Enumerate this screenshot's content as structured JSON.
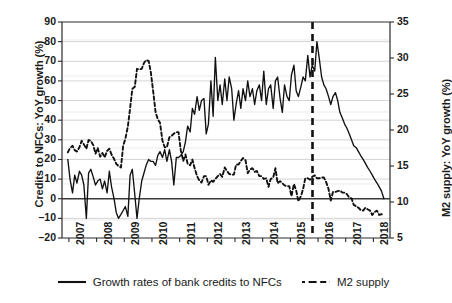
{
  "chart_data": {
    "type": "line",
    "title": "",
    "xlabel": "",
    "ylabel": "Credits to NFCs: YoY growth (%)",
    "ylabel_right": "M2 supply: YoY growth (%)",
    "grid": true,
    "legend_position": "bottom",
    "xlim": [
      2006.75,
      2018.6
    ],
    "ylim": [
      -20,
      90
    ],
    "ylim_right": [
      5,
      35
    ],
    "xticks": [
      "2007",
      "2008",
      "2009",
      "2010",
      "2011",
      "2012",
      "2013",
      "2014",
      "2015",
      "2016",
      "2017",
      "2018"
    ],
    "xtick_values": [
      2007,
      2008,
      2009,
      2010,
      2011,
      2012,
      2013,
      2014,
      2015,
      2016,
      2017,
      2018
    ],
    "yticks_left": [
      -20,
      -10,
      0,
      10,
      20,
      30,
      40,
      50,
      60,
      70,
      80,
      90
    ],
    "yticks_right": [
      5,
      10,
      15,
      20,
      25,
      30,
      35
    ],
    "zero_line": 0,
    "annotations": [
      {
        "name": "structural-break-line",
        "type": "vline",
        "x": 2015.8,
        "style": "dashed",
        "color": "#111111"
      }
    ],
    "series": [
      {
        "name": "Growth rates of bank credits to NFCs",
        "axis": "left",
        "style": "solid",
        "color": "#111111",
        "x": [
          2006.96,
          2007.04,
          2007.13,
          2007.21,
          2007.29,
          2007.38,
          2007.46,
          2007.54,
          2007.63,
          2007.71,
          2007.79,
          2007.88,
          2007.96,
          2008.04,
          2008.13,
          2008.21,
          2008.29,
          2008.38,
          2008.46,
          2008.54,
          2008.63,
          2008.71,
          2008.79,
          2008.88,
          2008.96,
          2009.04,
          2009.13,
          2009.21,
          2009.29,
          2009.38,
          2009.46,
          2009.54,
          2009.63,
          2009.71,
          2009.79,
          2009.88,
          2009.96,
          2010.04,
          2010.13,
          2010.21,
          2010.29,
          2010.38,
          2010.46,
          2010.54,
          2010.63,
          2010.71,
          2010.79,
          2010.88,
          2010.96,
          2011.04,
          2011.13,
          2011.21,
          2011.29,
          2011.38,
          2011.46,
          2011.54,
          2011.63,
          2011.71,
          2011.79,
          2011.88,
          2011.96,
          2012.04,
          2012.13,
          2012.21,
          2012.29,
          2012.38,
          2012.46,
          2012.54,
          2012.63,
          2012.71,
          2012.79,
          2012.88,
          2012.96,
          2013.04,
          2013.13,
          2013.21,
          2013.29,
          2013.38,
          2013.46,
          2013.54,
          2013.63,
          2013.71,
          2013.79,
          2013.88,
          2013.96,
          2014.04,
          2014.13,
          2014.21,
          2014.29,
          2014.38,
          2014.46,
          2014.54,
          2014.63,
          2014.71,
          2014.79,
          2014.88,
          2014.96,
          2015.04,
          2015.13,
          2015.21,
          2015.29,
          2015.38,
          2015.46,
          2015.54,
          2015.63,
          2015.71,
          2015.79,
          2015.88,
          2015.96,
          2016.04,
          2016.13,
          2016.21,
          2016.29,
          2016.38,
          2016.46,
          2016.54,
          2016.63,
          2016.71,
          2016.79,
          2016.88,
          2016.96,
          2017.04,
          2017.13,
          2017.21,
          2017.29,
          2017.38,
          2017.46,
          2017.54,
          2017.63,
          2017.71,
          2017.79,
          2017.88,
          2017.96,
          2018.04,
          2018.13,
          2018.21,
          2018.29,
          2018.38
        ],
        "y": [
          20,
          10,
          3,
          12,
          8,
          14,
          12,
          7,
          -10,
          13,
          15,
          11,
          7,
          9,
          10,
          5,
          9,
          3,
          14,
          6,
          0,
          -7,
          -10,
          -8,
          -6,
          -4,
          -9,
          12,
          15,
          2,
          -10,
          0,
          9,
          13,
          17,
          20,
          19,
          19,
          17,
          22,
          24,
          21,
          25,
          19,
          25,
          19,
          7,
          21,
          21,
          22,
          24,
          29,
          37,
          34,
          46,
          43,
          52,
          45,
          50,
          51,
          33,
          38,
          60,
          42,
          72,
          50,
          58,
          48,
          61,
          50,
          62,
          56,
          40,
          48,
          55,
          46,
          56,
          50,
          60,
          52,
          56,
          48,
          55,
          58,
          50,
          65,
          48,
          56,
          58,
          46,
          60,
          62,
          51,
          44,
          58,
          52,
          50,
          63,
          68,
          55,
          52,
          57,
          62,
          60,
          73,
          62,
          68,
          65,
          80,
          72,
          62,
          58,
          56,
          52,
          48,
          52,
          54,
          50,
          44,
          41,
          38,
          36,
          33,
          30,
          27,
          26,
          24,
          22,
          20,
          18,
          16,
          14,
          12,
          10,
          8,
          6,
          4,
          0
        ]
      },
      {
        "name": "M2 supply",
        "axis": "right",
        "style": "dashed",
        "color": "#111111",
        "x": [
          2006.96,
          2007.04,
          2007.13,
          2007.21,
          2007.29,
          2007.38,
          2007.46,
          2007.54,
          2007.63,
          2007.71,
          2007.79,
          2007.88,
          2007.96,
          2008.04,
          2008.13,
          2008.21,
          2008.29,
          2008.38,
          2008.46,
          2008.54,
          2008.63,
          2008.71,
          2008.79,
          2008.88,
          2008.96,
          2009.04,
          2009.13,
          2009.21,
          2009.29,
          2009.38,
          2009.46,
          2009.54,
          2009.63,
          2009.71,
          2009.79,
          2009.88,
          2009.96,
          2010.04,
          2010.13,
          2010.21,
          2010.29,
          2010.38,
          2010.46,
          2010.54,
          2010.63,
          2010.71,
          2010.79,
          2010.88,
          2010.96,
          2011.04,
          2011.13,
          2011.21,
          2011.29,
          2011.38,
          2011.46,
          2011.54,
          2011.63,
          2011.71,
          2011.79,
          2011.88,
          2011.96,
          2012.04,
          2012.13,
          2012.21,
          2012.29,
          2012.38,
          2012.46,
          2012.54,
          2012.63,
          2012.71,
          2012.79,
          2012.88,
          2012.96,
          2013.04,
          2013.13,
          2013.21,
          2013.29,
          2013.38,
          2013.46,
          2013.54,
          2013.63,
          2013.71,
          2013.79,
          2013.88,
          2013.96,
          2014.04,
          2014.13,
          2014.21,
          2014.29,
          2014.38,
          2014.46,
          2014.54,
          2014.63,
          2014.71,
          2014.79,
          2014.88,
          2014.96,
          2015.04,
          2015.13,
          2015.21,
          2015.29,
          2015.38,
          2015.46,
          2015.54,
          2015.63,
          2015.71,
          2015.79,
          2015.88,
          2015.96,
          2016.04,
          2016.13,
          2016.21,
          2016.29,
          2016.38,
          2016.46,
          2016.54,
          2016.63,
          2016.71,
          2016.79,
          2016.88,
          2016.96,
          2017.04,
          2017.13,
          2017.21,
          2017.29,
          2017.38,
          2017.46,
          2017.54,
          2017.63,
          2017.71,
          2017.79,
          2017.88,
          2017.96,
          2018.04,
          2018.13,
          2018.21,
          2018.29,
          2018.38
        ],
        "y": [
          16.9,
          17.5,
          17.8,
          17.2,
          17.0,
          17.6,
          18.5,
          18.0,
          17.4,
          18.6,
          18.5,
          17.9,
          16.7,
          17.5,
          16.3,
          16.8,
          16.2,
          17.1,
          17.4,
          16.6,
          16.0,
          15.3,
          15.0,
          14.8,
          17.8,
          18.8,
          20.5,
          23.0,
          25.7,
          26.0,
          28.5,
          28.4,
          28.5,
          29.3,
          29.7,
          29.6,
          28.0,
          25.5,
          22.5,
          21.5,
          21.0,
          18.5,
          17.6,
          17.6,
          19.0,
          19.2,
          19.5,
          19.7,
          19.7,
          17.2,
          15.7,
          16.6,
          15.3,
          15.1,
          15.9,
          14.7,
          13.6,
          13.0,
          12.7,
          13.6,
          13.6,
          12.4,
          13.0,
          12.8,
          13.2,
          13.6,
          13.9,
          13.5,
          14.8,
          14.3,
          13.9,
          13.8,
          13.8,
          15.2,
          15.2,
          15.7,
          16.1,
          15.8,
          14.0,
          14.5,
          14.7,
          14.2,
          14.3,
          13.6,
          13.6,
          13.2,
          13.3,
          12.1,
          13.2,
          13.4,
          14.7,
          12.6,
          12.9,
          12.6,
          12.3,
          12.2,
          12.2,
          10.8,
          12.5,
          11.6,
          10.1,
          10.8,
          11.8,
          13.3,
          13.3,
          13.1,
          13.5,
          13.7,
          13.3,
          13.3,
          13.4,
          13.4,
          12.8,
          11.8,
          10.2,
          11.4,
          11.4,
          11.5,
          11.6,
          11.3,
          11.3,
          11.1,
          10.6,
          10.5,
          9.6,
          9.4,
          9.2,
          8.9,
          8.8,
          9.2,
          9.0,
          8.8,
          8.2,
          8.6,
          8.8,
          8.2,
          8.3,
          8.3
        ]
      }
    ]
  },
  "axes": {
    "left_title": "Credits to NFCs: YoY growth (%)",
    "right_title": "M2 supply: YoY growth (%)"
  },
  "legend": {
    "items": [
      {
        "label": "Growth rates of bank credits to NFCs",
        "style": "solid"
      },
      {
        "label": "M2 supply",
        "style": "dashed"
      }
    ]
  }
}
